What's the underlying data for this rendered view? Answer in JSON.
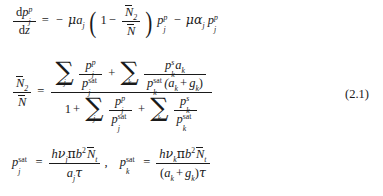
{
  "document": {
    "type": "equation-block",
    "equation_number": "(2.1)",
    "background_color": "#ffffff",
    "text_color": "#1a1a1a"
  },
  "equations": [
    {
      "id": "eq-pump-propagation",
      "description": "Pump power propagation along z",
      "latex": "\\frac{\\mathrm{d}p_j^p}{\\mathrm{d}z} = -\\mu a_j\\left(1-\\frac{\\bar{N}_2}{\\bar{N}}\\right)p_j^p - \\mu\\alpha_j p_j^p",
      "parts": {
        "lhs_num_d": "d",
        "lhs_num_base": "p",
        "lhs_num_sub": "j",
        "lhs_num_sup": "p",
        "lhs_den_d": "d",
        "lhs_den_var": "z",
        "equals": "=",
        "minus1": "−",
        "mu1": "μ",
        "a": "a",
        "a_sub": "j",
        "paren_open": "(",
        "one": "1",
        "minus_inner": "−",
        "frac_num_N": "N",
        "frac_num_sub": "2",
        "frac_den_N": "N",
        "paren_close": ")",
        "p1_base": "p",
        "p1_sub": "j",
        "p1_sup": "p",
        "minus2": "−",
        "mu2": "μ",
        "alpha": "α",
        "alpha_sub": "j",
        "p2_base": "p",
        "p2_sub": "j",
        "p2_sup": "p"
      }
    },
    {
      "id": "eq-upper-state-population-fraction",
      "description": "Fractional upper-state population",
      "latex": "\\frac{\\bar{N}_2}{\\bar{N}} = \\frac{\\sum_j \\frac{p_j^p}{p_j^{\\mathrm{sat}}} + \\sum_k \\frac{p_k^s a_k}{p_k^{\\mathrm{sat}}(a_k+g_k)}}{1+\\sum_j \\frac{p_j^p}{p_j^{\\mathrm{sat}}} + \\sum_k \\frac{p_k^s}{p_k^{\\mathrm{sat}}}}",
      "parts": {
        "lhs_num_N": "N",
        "lhs_num_sub": "2",
        "lhs_den_N": "N",
        "equals": "=",
        "sum1_symbol": "∑",
        "sum1_index": "j",
        "t1_num_base": "p",
        "t1_num_sub": "j",
        "t1_num_sup": "p",
        "t1_den_base": "p",
        "t1_den_sub": "j",
        "t1_den_sup": "sat",
        "plus1": "+",
        "sum2_symbol": "∑",
        "sum2_index": "k",
        "t2_num_base": "p",
        "t2_num_sub": "k",
        "t2_num_sup": "s",
        "t2_num_a": "a",
        "t2_num_a_sub": "k",
        "t2_den_base": "p",
        "t2_den_sub": "k",
        "t2_den_sup": "sat",
        "t2_den_group": "(a",
        "t2_den_group_sub": "k",
        "t2_den_plus": "+",
        "t2_den_g": "g",
        "t2_den_g_sub": "k",
        "t2_den_close": ")",
        "one": "1",
        "plus0": "+",
        "sum3_symbol": "∑",
        "sum3_index": "j",
        "t3_num_base": "p",
        "t3_num_sub": "j",
        "t3_num_sup": "p",
        "t3_den_base": "p",
        "t3_den_sub": "j",
        "t3_den_sup": "sat",
        "plus2": "+",
        "sum4_symbol": "∑",
        "sum4_index": "k",
        "t4_num_base": "p",
        "t4_num_sub": "k",
        "t4_num_sup": "s",
        "t4_den_base": "p",
        "t4_den_sub": "k",
        "t4_den_sup": "sat"
      }
    },
    {
      "id": "eq-saturation-powers",
      "description": "Saturation powers for pump and signal",
      "latex": "p_j^{\\mathrm{sat}} = \\frac{h\\nu_j \\pi b^2 \\bar{N}_t}{a_j \\tau}, \\quad p_k^{\\mathrm{sat}} = \\frac{h\\nu_k \\pi b^2 \\bar{N}_t}{(a_k+g_k)\\tau}",
      "parts": {
        "lhs1_base": "p",
        "lhs1_sub": "j",
        "lhs1_sup": "sat",
        "equals1": "=",
        "n1_h": "h",
        "n1_nu": "ν",
        "n1_nu_sub": "j",
        "n1_pi": "π",
        "n1_b": "b",
        "n1_b_sup": "2",
        "n1_N": "N",
        "n1_N_sub": "t",
        "d1_a": "a",
        "d1_a_sub": "j",
        "d1_tau": "τ",
        "comma": ",",
        "lhs2_base": "p",
        "lhs2_sub": "k",
        "lhs2_sup": "sat",
        "equals2": "=",
        "n2_h": "h",
        "n2_nu": "ν",
        "n2_nu_sub": "k",
        "n2_pi": "π",
        "n2_b": "b",
        "n2_b_sup": "2",
        "n2_N": "N",
        "n2_N_sub": "t",
        "d2_open": "(",
        "d2_a": "a",
        "d2_a_sub": "k",
        "d2_plus": "+",
        "d2_g": "g",
        "d2_g_sub": "k",
        "d2_close": ")",
        "d2_tau": "τ"
      }
    }
  ]
}
